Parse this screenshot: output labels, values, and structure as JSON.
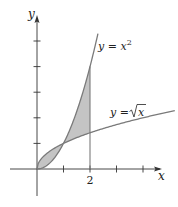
{
  "chart_data": {
    "type": "line",
    "title": "",
    "xlabel": "x",
    "ylabel": "y",
    "xlim": [
      -0.35,
      5.3
    ],
    "ylim": [
      -1.4,
      5.5
    ],
    "x_ticks": [
      1,
      2,
      3,
      4
    ],
    "x_tick_labels": [
      "",
      "2",
      "",
      ""
    ],
    "y_ticks": [
      1,
      2,
      3,
      4,
      5
    ],
    "y_tick_labels": [
      "",
      "",
      "",
      "",
      ""
    ],
    "grid": false,
    "series": [
      {
        "name": "y = x^2",
        "label": "y = x",
        "label_sup": "2",
        "function": "x^2",
        "x_range": [
          0,
          2.3
        ],
        "color": "#7a7a7a"
      },
      {
        "name": "y = sqrt(x)",
        "label": "y = ",
        "label_radicand": "x",
        "function": "sqrt(x)",
        "x_range": [
          0,
          5.2
        ],
        "color": "#7a7a7a"
      }
    ],
    "shaded_region": {
      "description": "Area between y = x^2 and y = sqrt(x) from x = 0 to x = 2",
      "x_range": [
        0,
        2
      ],
      "fill": "#c4c4c4",
      "intersection_points": [
        [
          0,
          0
        ],
        [
          1,
          1
        ]
      ]
    },
    "vertical_line": {
      "x": 2,
      "from_y": 0,
      "to_y": 4
    }
  },
  "colors": {
    "axis": "#333333",
    "curve": "#7a7a7a",
    "fill": "#c4c4c4",
    "background": "#ffffff"
  }
}
